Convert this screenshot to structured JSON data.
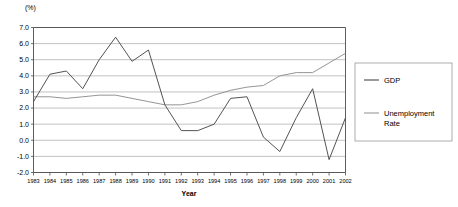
{
  "unit_label": "(%)",
  "legend": {
    "position": "right",
    "entries": [
      {
        "label": "GDP",
        "color": "#4a4a4a"
      },
      {
        "label": "Unemployment Rate",
        "color": "#9a9a9a"
      }
    ]
  },
  "chart_data": {
    "type": "line",
    "title": "",
    "subtitle": "",
    "xlabel": "Year",
    "ylabel": "(%)",
    "ylim": [
      -2.0,
      7.0
    ],
    "yticks": [
      "7.0",
      "6.0",
      "5.0",
      "4.0",
      "3.0",
      "2.0",
      "1.0",
      "0.0",
      "-1.0",
      "-2.0"
    ],
    "ytick_values": [
      7.0,
      6.0,
      5.0,
      4.0,
      3.0,
      2.0,
      1.0,
      0.0,
      -1.0,
      -2.0
    ],
    "grid": true,
    "legend_position": "right",
    "categories": [
      "1983",
      "1984",
      "1985",
      "1986",
      "1987",
      "1988",
      "1989",
      "1990",
      "1991",
      "1992",
      "1993",
      "1994",
      "1995",
      "1996",
      "1997",
      "1998",
      "1999",
      "2000",
      "2001",
      "2002"
    ],
    "x": [
      1983,
      1984,
      1985,
      1986,
      1987,
      1988,
      1989,
      1990,
      1991,
      1992,
      1993,
      1994,
      1995,
      1996,
      1997,
      1998,
      1999,
      2000,
      2001,
      2002
    ],
    "series": [
      {
        "name": "GDP",
        "color": "#4a4a4a",
        "values": [
          2.4,
          4.1,
          4.3,
          3.2,
          5.0,
          6.4,
          4.9,
          5.6,
          2.2,
          0.6,
          0.6,
          1.0,
          2.6,
          2.7,
          0.2,
          -0.7,
          1.4,
          3.2,
          -1.2,
          1.4
        ]
      },
      {
        "name": "Unemployment Rate",
        "color": "#9a9a9a",
        "values": [
          2.7,
          2.7,
          2.6,
          2.7,
          2.8,
          2.8,
          2.6,
          2.4,
          2.2,
          2.2,
          2.4,
          2.8,
          3.1,
          3.3,
          3.4,
          4.0,
          4.2,
          4.2,
          4.8,
          5.4
        ]
      }
    ]
  }
}
